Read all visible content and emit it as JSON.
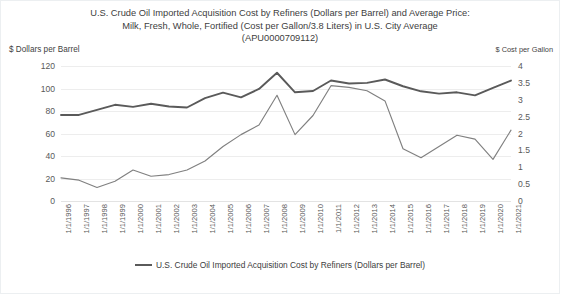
{
  "chart": {
    "title_lines": [
      "U.S. Crude Oil Imported Acquisition Cost by Refiners (Dollars per Barrel) and Average Price:",
      "Milk, Fresh, Whole, Fortified (Cost per Gallon/3.8 Liters) in U.S. City Average",
      "(APU0000709112)"
    ],
    "left_axis_caption": "$ Dollars per Barrel",
    "right_axis_caption": "$ Cost per Gallon",
    "legend": [
      {
        "label": "U.S. Crude Oil Imported Acquisition Cost by Refiners (Dollars per Barrel)",
        "color": "#5a5a5a"
      }
    ]
  },
  "chart_data": {
    "type": "line",
    "title": "U.S. Crude Oil Imported Acquisition Cost by Refiners (Dollars per Barrel) and Average Price: Milk, Fresh, Whole, Fortified (Cost per Gallon/3.8 Liters) in U.S. City Average (APU0000709112)",
    "xlabel": "",
    "ylabel": "$ Dollars per Barrel",
    "y2label": "$ Cost per Gallon",
    "grid": true,
    "legend_position": "bottom",
    "categories": [
      "1/1/1996",
      "1/1/1997",
      "1/1/1998",
      "1/1/1999",
      "1/1/2000",
      "1/1/2001",
      "1/1/2002",
      "1/1/2003",
      "1/1/2004",
      "1/1/2005",
      "1/1/2006",
      "1/1/2007",
      "1/1/2008",
      "1/1/2009",
      "1/1/2010",
      "1/1/2011",
      "1/1/2012",
      "1/1/2013",
      "1/1/2014",
      "1/1/2015",
      "1/1/2016",
      "1/1/2017",
      "1/1/2018",
      "1/1/2019",
      "1/1/2020",
      "1/1/2021"
    ],
    "ylim": [
      0,
      120
    ],
    "yticks": [
      0,
      20,
      40,
      60,
      80,
      100,
      120
    ],
    "y2lim": [
      0,
      4
    ],
    "y2ticks": [
      0,
      0.5,
      1,
      1.5,
      2,
      2.5,
      3,
      3.5,
      4
    ],
    "series": [
      {
        "name": "U.S. Crude Oil Imported Acquisition Cost by Refiners (Dollars per Barrel)",
        "axis": "left",
        "color": "#808080",
        "values": [
          20.5,
          18.5,
          12.0,
          17.5,
          27.5,
          22.0,
          23.5,
          27.5,
          35.5,
          48.5,
          59.0,
          67.5,
          94.0,
          59.0,
          76.0,
          102.5,
          101.0,
          98.0,
          89.0,
          46.5,
          38.5,
          48.5,
          58.5,
          55.0,
          37.0,
          63.0
        ]
      },
      {
        "name": "Average Price: Milk, Fresh, Whole, Fortified (Cost per Gallon/3.8 Liters) in U.S. City Average (APU0000709112)",
        "axis": "right",
        "color": "#5a5a5a",
        "values": [
          2.55,
          2.55,
          2.7,
          2.85,
          2.79,
          2.88,
          2.8,
          2.77,
          3.05,
          3.21,
          3.07,
          3.32,
          3.8,
          3.22,
          3.26,
          3.57,
          3.48,
          3.5,
          3.6,
          3.4,
          3.25,
          3.18,
          3.22,
          3.13,
          3.35,
          3.57
        ]
      }
    ]
  }
}
